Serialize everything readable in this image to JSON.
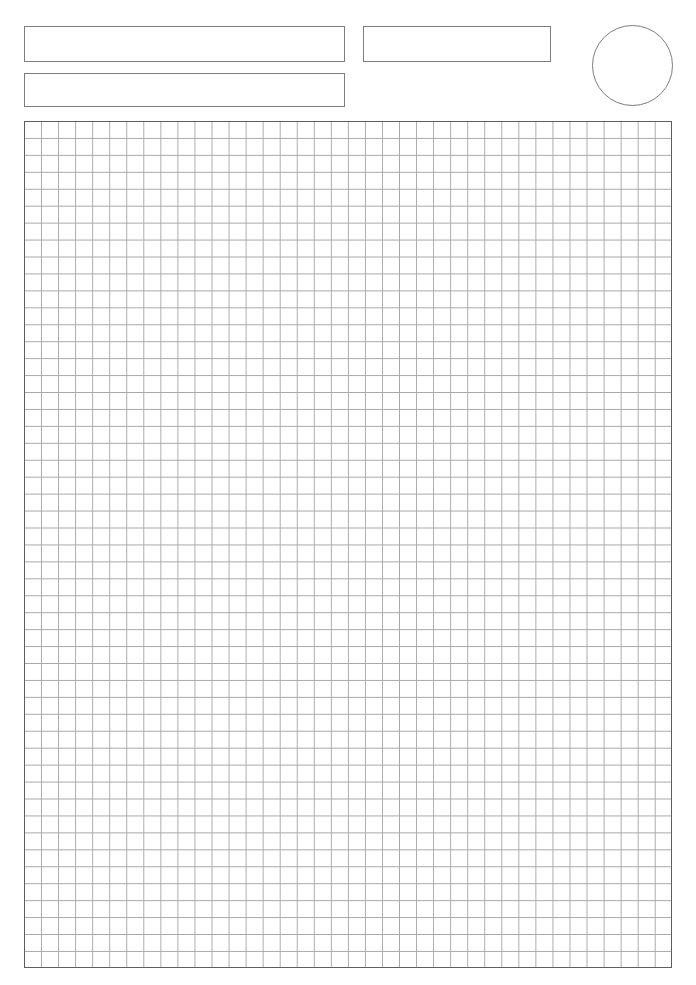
{
  "page": {
    "background_color": "#ffffff",
    "width": 696,
    "height": 985
  },
  "header": {
    "title_field": {
      "value": "",
      "placeholder": ""
    },
    "date_field": {
      "value": "",
      "placeholder": ""
    },
    "subtitle_field": {
      "value": "",
      "placeholder": ""
    },
    "badge": {
      "value": "",
      "shape": "circle-outline"
    }
  },
  "grid": {
    "columns": 38,
    "rows": 50,
    "cell_size_px": 17,
    "line_color": "#a9a9a9",
    "border_color": "#5e5e5e",
    "fill_color": "#ffffff"
  }
}
